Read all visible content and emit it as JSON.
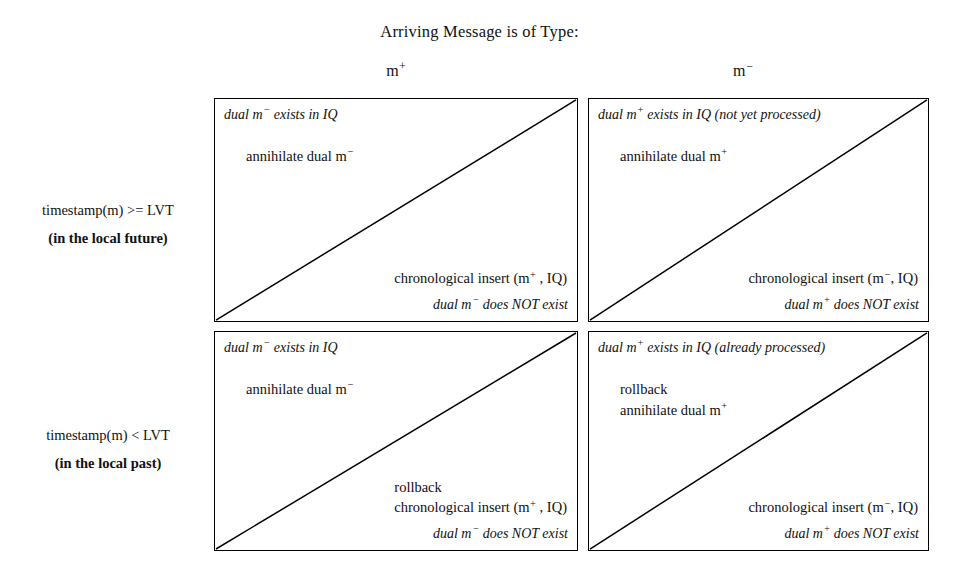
{
  "title": "Arriving Message is of Type:",
  "columns": [
    {
      "id": "mplus",
      "label_base": "m",
      "label_sign": "+"
    },
    {
      "id": "mminus",
      "label_base": "m",
      "label_sign": "−"
    }
  ],
  "rows": [
    {
      "id": "future",
      "condition": "timestamp(m) >= LVT",
      "note": "(in the local future)"
    },
    {
      "id": "past",
      "condition": "timestamp(m) < LVT",
      "note": "(in the local past)"
    }
  ],
  "cells": {
    "future_mplus": {
      "condition_top": "dual m− exists in IQ",
      "action_top": "annihilate dual m−",
      "action_bottom_line1": "",
      "action_bottom_line2": "chronological insert (m+ , IQ)",
      "condition_bottom": "dual m− does NOT exist"
    },
    "future_mminus": {
      "condition_top": "dual m+ exists in IQ (not yet processed)",
      "action_top": "annihilate dual m+",
      "action_bottom_line1": "",
      "action_bottom_line2": "chronological insert (m−, IQ)",
      "condition_bottom": "dual m+ does NOT exist"
    },
    "past_mplus": {
      "condition_top": "dual m− exists in IQ",
      "action_top": "annihilate dual m−",
      "action_bottom_line1": "rollback",
      "action_bottom_line2": "chronological insert (m+ , IQ)",
      "condition_bottom": "dual m− does NOT exist"
    },
    "past_mminus": {
      "condition_top": "dual m+ exists in IQ (already processed)",
      "action_top_line1": "rollback",
      "action_top_line2": "annihilate dual m+",
      "action_bottom_line1": "",
      "action_bottom_line2": "chronological insert (m−, IQ)",
      "condition_bottom": "dual m+ does NOT exist"
    }
  },
  "colors": {
    "background": "#ffffff",
    "ink": "#000000",
    "border": "#000000"
  }
}
